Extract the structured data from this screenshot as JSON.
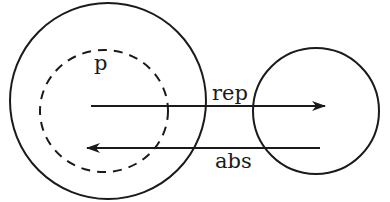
{
  "diagram": {
    "labels": {
      "inner_set": "p",
      "forward_arrow": "rep",
      "backward_arrow": "abs"
    },
    "colors": {
      "background": "#ffffff",
      "ink": "#1a1a1a"
    },
    "shapes": {
      "large_circle": {
        "cx": 108,
        "cy": 101,
        "r": 98,
        "style": "solid"
      },
      "dashed_circle": {
        "cx": 104,
        "cy": 111,
        "rx": 64,
        "ry": 61,
        "style": "dashed"
      },
      "small_circle": {
        "cx": 316,
        "cy": 111,
        "r": 63,
        "style": "solid"
      }
    },
    "arrows": [
      {
        "name": "rep",
        "from": [
          91,
          106
        ],
        "to": [
          324,
          106
        ],
        "direction": "right"
      },
      {
        "name": "abs",
        "from": [
          320,
          148
        ],
        "to": [
          88,
          148
        ],
        "direction": "left"
      }
    ]
  }
}
